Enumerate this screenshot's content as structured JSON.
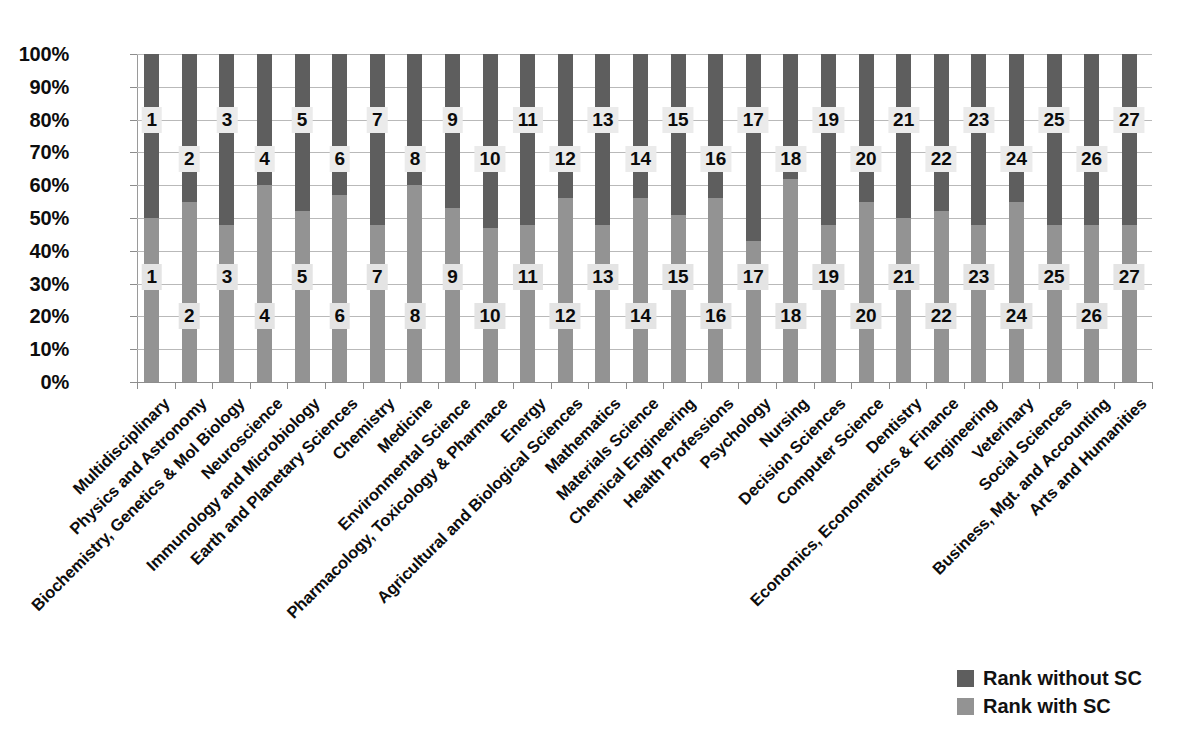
{
  "chart_data": {
    "type": "bar",
    "subtype": "stacked-100-percent",
    "title": "",
    "xlabel": "",
    "ylabel": "",
    "ylim": [
      0,
      100
    ],
    "grid": true,
    "legend_position": "bottom-right",
    "y_tick_labels": [
      "100%",
      "90%",
      "80%",
      "70%",
      "60%",
      "50%",
      "40%",
      "30%",
      "20%",
      "10%",
      "0%"
    ],
    "y_tick_values": [
      100,
      90,
      80,
      70,
      60,
      50,
      40,
      30,
      20,
      10,
      0
    ],
    "categories": [
      "Multidisciplinary",
      "Physics and Astronomy",
      "Biochemistry, Genetics & Mol Biology",
      "Neuroscience",
      "Immunology and Microbiology",
      "Earth and Planetary Sciences",
      "Chemistry",
      "Medicine",
      "Environmental Science",
      "Pharmacology, Toxicology & Pharmace",
      "Energy",
      "Agricultural and Biological Sciences",
      "Mathematics",
      "Materials Science",
      "Chemical Engineering",
      "Health Professions",
      "Psychology",
      "Nursing",
      "Decision Sciences",
      "Computer Science",
      "Dentistry",
      "Economics, Econometrics & Finance",
      "Engineering",
      "Veterinary",
      "Social Sciences",
      "Business, Mgt. and Accounting",
      "Arts and Humanities"
    ],
    "series": [
      {
        "name": "Rank without SC",
        "color": "#5e5e5e",
        "label_position_pct": 80,
        "values": [
          1,
          2,
          3,
          4,
          5,
          6,
          7,
          8,
          9,
          10,
          11,
          12,
          13,
          14,
          15,
          16,
          17,
          18,
          19,
          20,
          21,
          22,
          23,
          24,
          25,
          26,
          27
        ],
        "segment_share_pct": [
          50,
          45,
          52,
          40,
          48,
          43,
          52,
          40,
          47,
          53,
          52,
          44,
          52,
          44,
          49,
          44,
          57,
          38,
          52,
          45,
          50,
          48,
          52,
          45,
          52,
          52,
          52
        ]
      },
      {
        "name": "Rank with SC",
        "color": "#939393",
        "label_position_pct": 30,
        "values": [
          1,
          2,
          3,
          4,
          5,
          6,
          7,
          8,
          9,
          10,
          11,
          12,
          13,
          14,
          15,
          16,
          17,
          18,
          19,
          20,
          21,
          22,
          23,
          24,
          25,
          26,
          27
        ],
        "segment_share_pct": [
          50,
          55,
          48,
          60,
          52,
          57,
          48,
          60,
          53,
          47,
          48,
          56,
          48,
          56,
          51,
          56,
          43,
          62,
          48,
          55,
          50,
          52,
          48,
          55,
          48,
          48,
          48
        ]
      }
    ],
    "rank_labels_without_sc": [
      1,
      2,
      3,
      4,
      5,
      6,
      7,
      8,
      9,
      10,
      11,
      12,
      13,
      14,
      15,
      16,
      17,
      18,
      19,
      20,
      21,
      22,
      23,
      24,
      25,
      26,
      27
    ],
    "rank_labels_with_sc": [
      1,
      2,
      3,
      4,
      5,
      6,
      7,
      8,
      9,
      10,
      11,
      12,
      13,
      14,
      15,
      16,
      17,
      18,
      19,
      20,
      21,
      22,
      23,
      24,
      25,
      26,
      27
    ]
  },
  "legend": {
    "items": [
      {
        "label": "Rank without SC",
        "color": "#5e5e5e"
      },
      {
        "label": "Rank with SC",
        "color": "#939393"
      }
    ]
  }
}
